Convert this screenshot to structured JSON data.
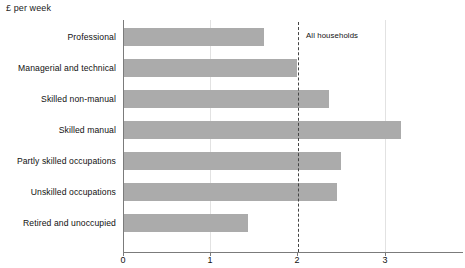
{
  "chart_data": {
    "type": "bar",
    "orientation": "horizontal",
    "title": "",
    "subtitle": "",
    "xlabel": "",
    "ylabel": "",
    "unit_label": "£ per week",
    "categories": [
      "Professional",
      "Managerial and technical",
      "Skilled non-manual",
      "Skilled manual",
      "Partly skilled occupations",
      "Unskilled occupations",
      "Retired and unoccupied"
    ],
    "values": [
      1.6,
      1.98,
      2.35,
      3.17,
      2.49,
      2.44,
      1.42
    ],
    "xlim": [
      0,
      3.9
    ],
    "xticks": [
      0,
      1,
      2,
      3
    ],
    "xtick_labels": [
      "0",
      "1",
      "2",
      "3"
    ],
    "grid": "vertical-light",
    "legend": "none",
    "bar_color": "#ababab",
    "axis_color": "#7b7b7b",
    "annotations": [
      {
        "name": "all-households",
        "label": "All households",
        "type": "reference-line",
        "value": 2.0,
        "style": "dashed",
        "color": "#444444"
      }
    ]
  }
}
